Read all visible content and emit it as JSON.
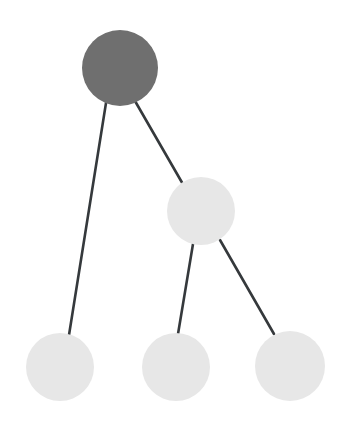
{
  "diagram": {
    "type": "node-link-tree",
    "width": 346,
    "height": 428,
    "background_color": "#ffffff",
    "edge_color": "#35393c",
    "edge_width": 2.6,
    "node_fill_root": "#6f6f6f",
    "node_fill_leaf": "#e7e7e7",
    "nodes": [
      {
        "id": "root",
        "label": "root-node",
        "cx": 120,
        "cy": 68,
        "r": 38,
        "fill": "#6f6f6f",
        "role": "root",
        "depth": 0
      },
      {
        "id": "branch",
        "label": "branch-node",
        "cx": 201,
        "cy": 211,
        "r": 34,
        "fill": "#e7e7e7",
        "role": "branch",
        "depth": 1
      },
      {
        "id": "leaf-left",
        "label": "leaf-node-left",
        "cx": 60,
        "cy": 367,
        "r": 34,
        "fill": "#e7e7e7",
        "role": "leaf",
        "depth": 1
      },
      {
        "id": "leaf-middle",
        "label": "leaf-node-middle",
        "cx": 176,
        "cy": 367,
        "r": 34,
        "fill": "#e7e7e7",
        "role": "leaf",
        "depth": 2
      },
      {
        "id": "leaf-right",
        "label": "leaf-node-right",
        "cx": 290,
        "cy": 366,
        "r": 35,
        "fill": "#e7e7e7",
        "role": "leaf",
        "depth": 2
      }
    ],
    "edges": [
      {
        "id": "edge-root-leafleft",
        "from": "root",
        "to": "leaf-left",
        "x1": 106,
        "y1": 103,
        "x2": 69,
        "y2": 335
      },
      {
        "id": "edge-root-branch",
        "from": "root",
        "to": "branch",
        "x1": 135,
        "y1": 101,
        "x2": 184,
        "y2": 186
      },
      {
        "id": "edge-branch-leafmiddle",
        "from": "branch",
        "to": "leaf-middle",
        "x1": 193,
        "y1": 244,
        "x2": 178,
        "y2": 334
      },
      {
        "id": "edge-branch-leafright",
        "from": "branch",
        "to": "leaf-right",
        "x1": 220,
        "y1": 240,
        "x2": 274,
        "y2": 334
      }
    ]
  }
}
